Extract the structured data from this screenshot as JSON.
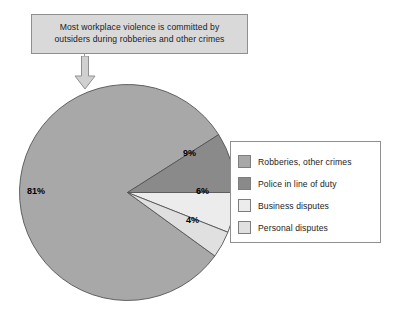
{
  "callout": {
    "line1": "Most workplace violence is committed by",
    "line2": "outsiders during robberies and other crimes",
    "fill_color": "#d9d9d9",
    "border_color": "#8f8f8f"
  },
  "arrow": {
    "name": "down-arrow",
    "fill_color": "#d0d0d0",
    "border_color": "#909090"
  },
  "legend": {
    "items": [
      {
        "label": "Robberies, other crimes",
        "color": "#a8a8a8"
      },
      {
        "label": "Police in line of duty",
        "color": "#8a8a8a"
      },
      {
        "label": "Business disputes",
        "color": "#ececec"
      },
      {
        "label": "Personal disputes",
        "color": "#e0e0e0"
      }
    ]
  },
  "pie_labels": {
    "robberies": "81%",
    "police": "9%",
    "business": "6%",
    "personal": "4%"
  },
  "chart_data": {
    "type": "pie",
    "title": "Most workplace violence is committed by outsiders during robberies and other crimes",
    "categories": [
      "Robberies, other crimes",
      "Police in line of duty",
      "Business disputes",
      "Personal disputes"
    ],
    "values": [
      81,
      9,
      6,
      4
    ],
    "value_labels": [
      "81%",
      "9%",
      "6%",
      "4%"
    ],
    "colors": [
      "#a8a8a8",
      "#8a8a8a",
      "#ececec",
      "#e0e0e0"
    ],
    "units": "percent",
    "total": 100,
    "legend_position": "right",
    "slice_border_color": "#555555",
    "start_angle_deg": 0,
    "direction": "counterclockwise-from-3-oclock",
    "geometry": {
      "cx": 109.5,
      "cy": 109.5,
      "r": 108
    }
  }
}
